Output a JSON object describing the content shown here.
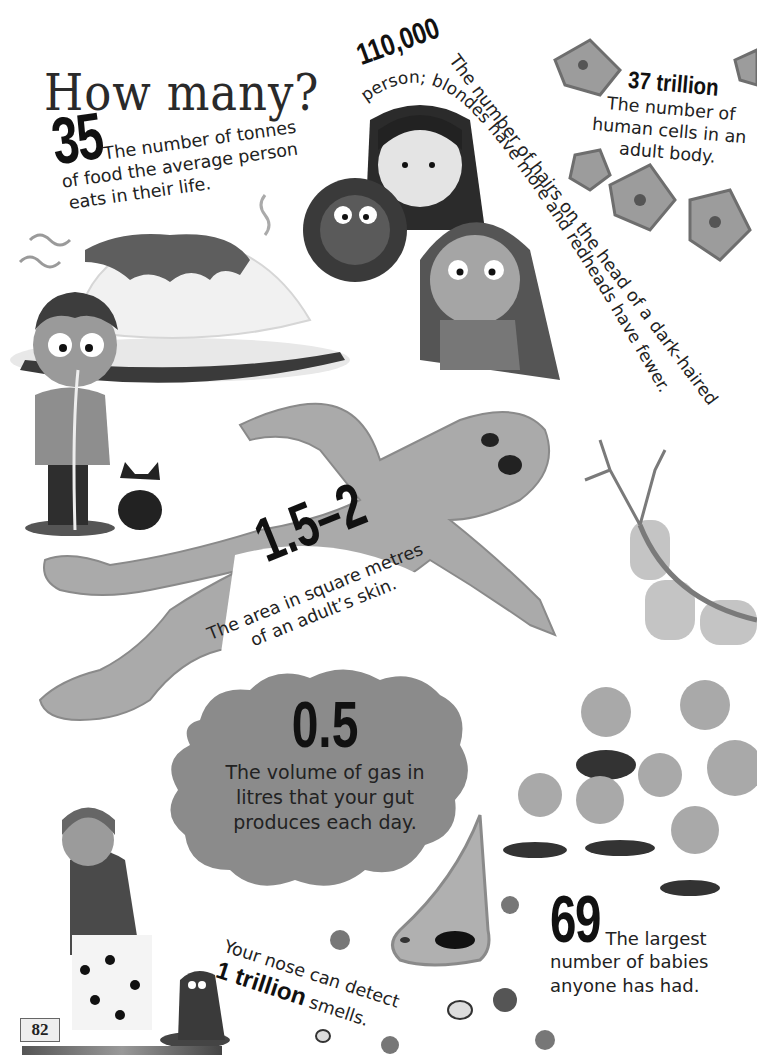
{
  "page": {
    "title": "How many?",
    "page_number": "82"
  },
  "facts": {
    "food": {
      "number": "35",
      "text_line1": "The number of tonnes",
      "text_line2": "of food the average person",
      "text_line3": "eats in their life."
    },
    "hairs": {
      "number": "110,000",
      "text_part1": "The number of hairs on the head of a dark-haired",
      "text_part2": "person; blondes have more and redheads have fewer."
    },
    "cells": {
      "number": "37 trillion",
      "text_line1": "The number of",
      "text_line2": "human cells in an",
      "text_line3": "adult body."
    },
    "skin": {
      "number": "1.5–2",
      "text_line1": "The area in square metres",
      "text_line2": "of an adult’s skin."
    },
    "gas": {
      "number": "0.5",
      "text_line1": "The volume of gas in",
      "text_line2": "litres that your gut",
      "text_line3": "produces each day."
    },
    "smell": {
      "text_line1": "Your nose can detect",
      "number": "1 trillion",
      "text_suffix": "smells."
    },
    "babies": {
      "number": "69",
      "text_line1": "The largest",
      "text_line2": "number of babies",
      "text_line3": "anyone has had."
    }
  },
  "colors": {
    "ink": "#1e1e1e",
    "skin_gray": "#a9a9a9",
    "cloud_gray": "#8a8a8a",
    "background": "#ffffff"
  }
}
